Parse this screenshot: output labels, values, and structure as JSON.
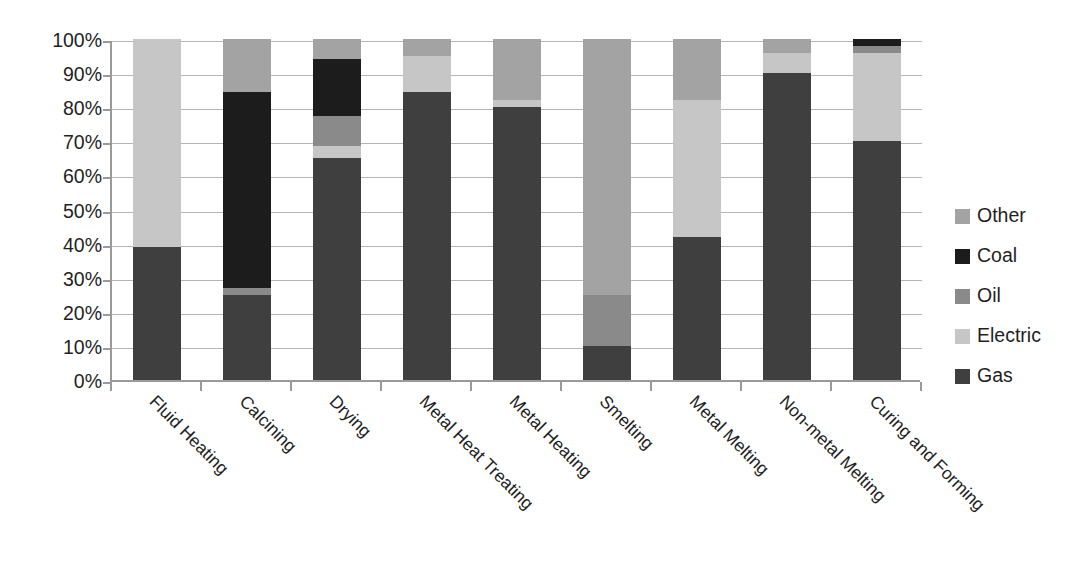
{
  "chart_data": {
    "type": "bar",
    "subtype": "stacked-100-percent",
    "title": "",
    "xlabel": "",
    "ylabel": "",
    "ylim": [
      0,
      100
    ],
    "grid": true,
    "legend_position": "right",
    "y_tick_labels": [
      "100%",
      "90%",
      "80%",
      "70%",
      "60%",
      "50%",
      "40%",
      "30%",
      "20%",
      "10%",
      "0%"
    ],
    "y_ticks": [
      100,
      90,
      80,
      70,
      60,
      50,
      40,
      30,
      20,
      10,
      0
    ],
    "categories": [
      "Fluid Heating",
      "Calcining",
      "Drying",
      "Metal Heat Treating",
      "Metal Heating",
      "Smelting",
      "Metal Melting",
      "Non-metal Melting",
      "Curing and Forming"
    ],
    "series": [
      {
        "name": "Gas",
        "color": "#3f3f3f",
        "values": [
          39,
          25,
          65,
          84.5,
          80,
          10,
          42,
          90,
          70
        ]
      },
      {
        "name": "Electric",
        "color": "#c6c6c6",
        "values": [
          61,
          0,
          3.5,
          10.5,
          2,
          0,
          40,
          6,
          26
        ]
      },
      {
        "name": "Oil",
        "color": "#8a8a8a",
        "values": [
          0,
          2,
          9,
          0,
          0,
          15,
          0,
          0,
          2
        ]
      },
      {
        "name": "Coal",
        "color": "#1c1c1c",
        "values": [
          0,
          57.5,
          16.5,
          0,
          0,
          0,
          0,
          0,
          2
        ]
      },
      {
        "name": "Other",
        "color": "#a3a3a3",
        "values": [
          0,
          15.5,
          6,
          5,
          18,
          75,
          18,
          4,
          0
        ]
      }
    ],
    "legend_order": [
      "Other",
      "Coal",
      "Oil",
      "Electric",
      "Gas"
    ]
  },
  "colors": {
    "other": "#a3a3a3",
    "coal": "#1c1c1c",
    "oil": "#8a8a8a",
    "electric": "#c6c6c6",
    "gas": "#3f3f3f",
    "gridline": "#b5b5b5",
    "axis": "#9a9a9a",
    "text": "#1f1f1f",
    "background": "#ffffff"
  }
}
